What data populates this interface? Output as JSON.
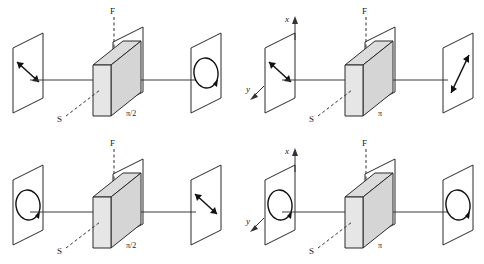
{
  "figure": {
    "panel_count": 4,
    "colors": {
      "ink": "#1a1a1a",
      "line": "#2b2b2b",
      "ray": "#3a3a3a",
      "plate_fill": "#e3e3e3",
      "plate_top_fill": "#dcdcdc",
      "background": "#ffffff"
    },
    "labels": {
      "fast_axis": "F",
      "slow_axis": "S",
      "axis_x": "x",
      "axis_y": "y"
    }
  },
  "panels": [
    {
      "id": "panel-top-left",
      "retardation": "π/2",
      "fast_axis": "F",
      "slow_axis": "S",
      "show_axes": false,
      "input_state": "linear-diagonal",
      "output_state": "circular",
      "input_description": "Linear polarization at 45 degrees (double-headed arrow)",
      "output_description": "Circular polarization (circle with rotation arrowhead)"
    },
    {
      "id": "panel-top-right",
      "retardation": "π",
      "fast_axis": "F",
      "slow_axis": "S",
      "show_axes": true,
      "axis_x": "x",
      "axis_y": "y",
      "input_state": "linear-diagonal",
      "output_state": "linear-diagonal-reflected",
      "input_description": "Linear polarization at 45 degrees (double-headed arrow)",
      "output_description": "Linear polarization rotated to the mirrored 45 degree azimuth"
    },
    {
      "id": "panel-bottom-left",
      "retardation": "π/2",
      "fast_axis": "F",
      "slow_axis": "S",
      "show_axes": false,
      "input_state": "circular",
      "output_state": "linear-diagonal",
      "input_description": "Circular polarization (circle with rotation arrowhead)",
      "output_description": "Linear polarization at 45 degrees (double-headed arrow)"
    },
    {
      "id": "panel-bottom-right",
      "retardation": "π",
      "fast_axis": "F",
      "slow_axis": "S",
      "show_axes": true,
      "axis_x": "x",
      "axis_y": "y",
      "input_state": "circular",
      "output_state": "circular-reversed",
      "input_description": "Circular polarization (circle with rotation arrowhead)",
      "output_description": "Circular polarization of opposite handedness"
    }
  ]
}
